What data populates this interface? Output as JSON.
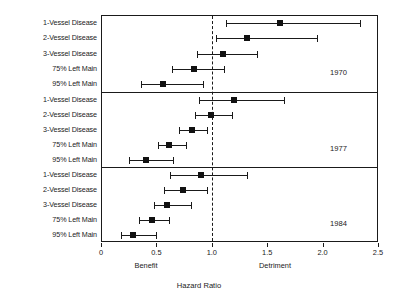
{
  "chart_data": {
    "type": "scatter",
    "subtype": "forest-plot",
    "title": "",
    "xlabel": "Hazard Ratio",
    "ylabel": "",
    "xlim": [
      0,
      2.5
    ],
    "xticks": [
      0,
      0.5,
      1.0,
      1.5,
      2.0,
      2.5
    ],
    "xticklabels": [
      "0",
      "0.5",
      "1.0",
      "1.5",
      "2.0",
      "2.5"
    ],
    "grid": false,
    "legend": null,
    "reference_line": {
      "x": 1.0,
      "style": "dashed"
    },
    "annotations": [
      {
        "text": "Benefit",
        "x": 0.5,
        "position": "below-axis"
      },
      {
        "text": "Detriment",
        "x": 1.55,
        "position": "below-axis"
      }
    ],
    "categories": [
      "1-Vessel Disease",
      "2-Vessel Disease",
      "3-Vessel Disease",
      "75% Left Main",
      "95% Left Main"
    ],
    "panels": [
      {
        "label": "1970",
        "points": [
          {
            "category": "1-Vessel Disease",
            "value": 1.62,
            "ci_low": 1.13,
            "ci_high": 2.34
          },
          {
            "category": "2-Vessel Disease",
            "value": 1.32,
            "ci_low": 1.04,
            "ci_high": 1.95
          },
          {
            "category": "3-Vessel Disease",
            "value": 1.1,
            "ci_low": 0.87,
            "ci_high": 1.41
          },
          {
            "category": "75% Left Main",
            "value": 0.84,
            "ci_low": 0.64,
            "ci_high": 1.11
          },
          {
            "category": "95% Left Main",
            "value": 0.56,
            "ci_low": 0.36,
            "ci_high": 0.92
          }
        ]
      },
      {
        "label": "1977",
        "points": [
          {
            "category": "1-Vessel Disease",
            "value": 1.2,
            "ci_low": 0.88,
            "ci_high": 1.65
          },
          {
            "category": "2-Vessel Disease",
            "value": 0.99,
            "ci_low": 0.85,
            "ci_high": 1.18
          },
          {
            "category": "3-Vessel Disease",
            "value": 0.82,
            "ci_low": 0.7,
            "ci_high": 0.96
          },
          {
            "category": "75% Left Main",
            "value": 0.61,
            "ci_low": 0.51,
            "ci_high": 0.77
          },
          {
            "category": "95% Left Main",
            "value": 0.41,
            "ci_low": 0.25,
            "ci_high": 0.65
          }
        ]
      },
      {
        "label": "1984",
        "points": [
          {
            "category": "1-Vessel Disease",
            "value": 0.9,
            "ci_low": 0.62,
            "ci_high": 1.32
          },
          {
            "category": "2-Vessel Disease",
            "value": 0.74,
            "ci_low": 0.57,
            "ci_high": 0.96
          },
          {
            "category": "3-Vessel Disease",
            "value": 0.6,
            "ci_low": 0.48,
            "ci_high": 0.81
          },
          {
            "category": "75% Left Main",
            "value": 0.46,
            "ci_low": 0.34,
            "ci_high": 0.61
          },
          {
            "category": "95% Left Main",
            "value": 0.29,
            "ci_low": 0.18,
            "ci_high": 0.5
          }
        ]
      }
    ]
  },
  "layout": {
    "plot_left": 101,
    "plot_right": 378,
    "plot_top": 15,
    "plot_bottom": 242,
    "panel_dividers": [
      92,
      167
    ],
    "label_right_edge": 97,
    "year_label_x": 330,
    "colors": {
      "ink": "#1a1a1a",
      "marker": "#111111",
      "background": "#ffffff"
    }
  }
}
